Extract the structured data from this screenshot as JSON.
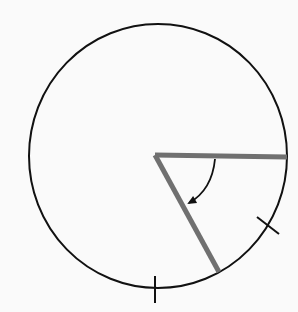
{
  "diagram": {
    "colors": {
      "background": "#fafafa",
      "circle_stroke": "#111111",
      "radius_stroke": "#707070",
      "arrow": "#111111",
      "tick": "#111111"
    },
    "circle": {
      "cx": 158,
      "cy": 156,
      "rx": 129,
      "ry": 132
    },
    "vertex": {
      "x": 155,
      "y": 155
    },
    "radii": [
      {
        "name": "horizontal-radius",
        "x2": 287,
        "y2": 157
      },
      {
        "name": "slanted-radius",
        "x2": 219,
        "y2": 272
      }
    ],
    "arrow": {
      "start": [
        215,
        159
      ],
      "control": [
        212,
        190
      ],
      "end": [
        189,
        203
      ]
    },
    "ticks": [
      {
        "name": "bottom-tick",
        "x1": 155,
        "y1": 276,
        "x2": 155,
        "y2": 303
      },
      {
        "name": "right-lower-tick",
        "x1": 257,
        "y1": 217,
        "x2": 279,
        "y2": 234
      }
    ]
  }
}
